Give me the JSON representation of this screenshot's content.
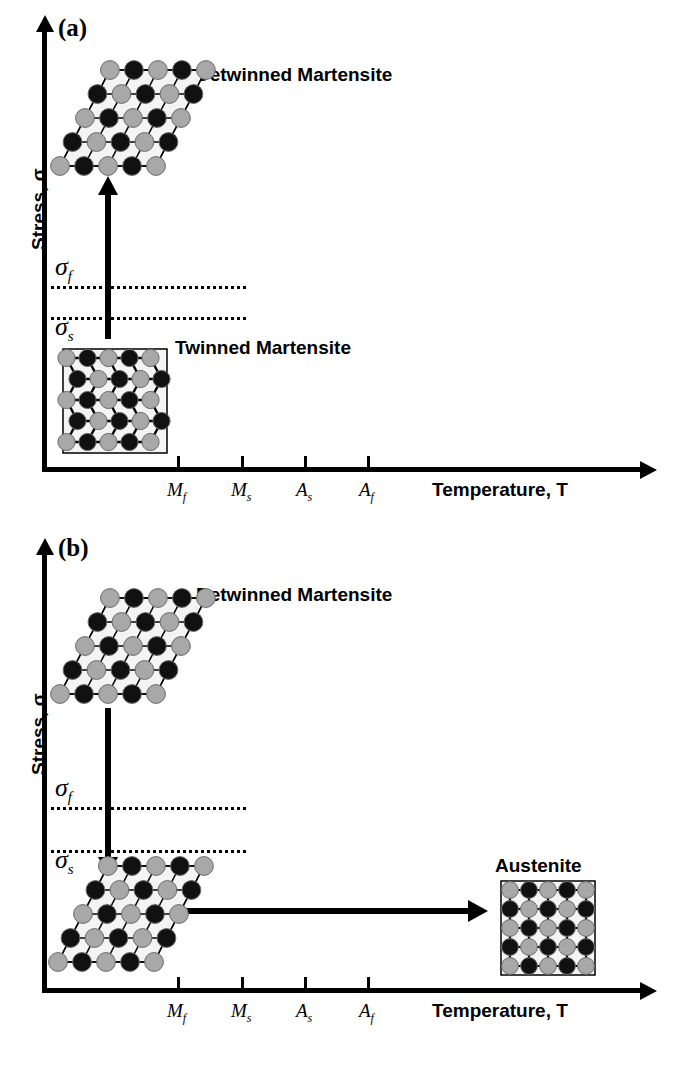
{
  "figure": {
    "type": "schematic-diagram"
  },
  "panels": [
    {
      "tag": "(a)",
      "process": "loading: twinned martensite detwins under increasing stress",
      "yaxis_label": "Stress, σ",
      "xaxis_label": "Temperature, T",
      "stress_levels": [
        {
          "symbol": "σ",
          "sub": "f",
          "name": "detwinning-finish-stress"
        },
        {
          "symbol": "σ",
          "sub": "s",
          "name": "detwinning-start-stress"
        }
      ],
      "ticks": [
        {
          "symbol": "M",
          "sub": "f"
        },
        {
          "symbol": "M",
          "sub": "s"
        },
        {
          "symbol": "A",
          "sub": "s"
        },
        {
          "symbol": "A",
          "sub": "f"
        }
      ],
      "phases": [
        {
          "label": "Detwinned Martensite",
          "lattice": "sheared"
        },
        {
          "label": "Twinned Martensite",
          "lattice": "twinned"
        }
      ],
      "arrows": [
        {
          "name": "loading-arrow",
          "direction": "up"
        }
      ]
    },
    {
      "tag": "(b)",
      "process": "unloading then heating: detwinned martensite transforms to austenite",
      "yaxis_label": "Stress, σ",
      "xaxis_label": "Temperature, T",
      "stress_levels": [
        {
          "symbol": "σ",
          "sub": "f",
          "name": "detwinning-finish-stress"
        },
        {
          "symbol": "σ",
          "sub": "s",
          "name": "detwinning-start-stress"
        }
      ],
      "ticks": [
        {
          "symbol": "M",
          "sub": "f"
        },
        {
          "symbol": "M",
          "sub": "s"
        },
        {
          "symbol": "A",
          "sub": "s"
        },
        {
          "symbol": "A",
          "sub": "f"
        }
      ],
      "phases": [
        {
          "label": "Detwinned Martensite",
          "lattice": "sheared"
        },
        {
          "label": "Austenite",
          "lattice": "cubic"
        }
      ],
      "arrows": [
        {
          "name": "unloading-arrow",
          "direction": "down"
        },
        {
          "name": "heating-arrow",
          "direction": "right"
        }
      ]
    }
  ],
  "colors": {
    "line": "#000000",
    "atom_dark": "#111111",
    "atom_light": "#a8a8a8",
    "lattice_fill": "#f4f4f4",
    "background": "#ffffff"
  }
}
